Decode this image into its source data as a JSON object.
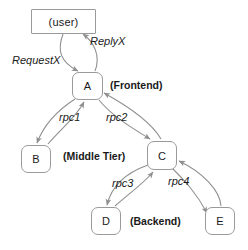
{
  "diagram": {
    "stroke_color": "#8f8f8f",
    "text_color": "#1a1a1a",
    "background": "#ffffff",
    "nodes": [
      {
        "id": "user",
        "label": "(user)",
        "shape": "square",
        "x": 31,
        "y": 9,
        "w": 65,
        "h": 25
      },
      {
        "id": "A",
        "label": "A",
        "shape": "rounded",
        "x": 72,
        "y": 72,
        "w": 31,
        "h": 28
      },
      {
        "id": "B",
        "label": "B",
        "shape": "rounded",
        "x": 21,
        "y": 145,
        "w": 30,
        "h": 28
      },
      {
        "id": "C",
        "label": "C",
        "shape": "rounded",
        "x": 147,
        "y": 141,
        "w": 30,
        "h": 29
      },
      {
        "id": "D",
        "label": "D",
        "shape": "rounded",
        "x": 91,
        "y": 207,
        "w": 30,
        "h": 28
      },
      {
        "id": "E",
        "label": "E",
        "shape": "rounded",
        "x": 205,
        "y": 207,
        "w": 30,
        "h": 28
      }
    ],
    "edge_labels": [
      {
        "id": "requestx",
        "text": "RequestX",
        "style": "italic",
        "x": 12,
        "y": 55
      },
      {
        "id": "replyx",
        "text": "ReplyX",
        "style": "italic",
        "x": 90,
        "y": 36
      },
      {
        "id": "rpc1",
        "text": "rpc1",
        "style": "italic",
        "x": 59,
        "y": 112
      },
      {
        "id": "rpc2",
        "text": "rpc2",
        "style": "italic",
        "x": 106,
        "y": 112
      },
      {
        "id": "rpc3",
        "text": "rpc3",
        "style": "italic",
        "x": 112,
        "y": 178
      },
      {
        "id": "rpc4",
        "text": "rpc4",
        "style": "italic",
        "x": 168,
        "y": 176
      }
    ],
    "tier_labels": [
      {
        "id": "frontend",
        "text": "(Frontend)",
        "style": "bold",
        "x": 110,
        "y": 80
      },
      {
        "id": "middle-tier",
        "text": "(Middle Tier)",
        "style": "bold",
        "x": 63,
        "y": 151
      },
      {
        "id": "backend",
        "text": "(Backend)",
        "style": "bold",
        "x": 130,
        "y": 216
      }
    ],
    "edges": [
      {
        "id": "user-to-a",
        "from": "user",
        "to": "A",
        "label": "RequestX"
      },
      {
        "id": "a-to-user",
        "from": "A",
        "to": "user",
        "label": "ReplyX"
      },
      {
        "id": "a-to-b",
        "from": "A",
        "to": "B",
        "label": "rpc1"
      },
      {
        "id": "b-to-a",
        "from": "B",
        "to": "A",
        "label": "rpc1"
      },
      {
        "id": "a-to-c",
        "from": "A",
        "to": "C",
        "label": "rpc2"
      },
      {
        "id": "c-to-a",
        "from": "C",
        "to": "A",
        "label": "rpc2"
      },
      {
        "id": "c-to-d",
        "from": "C",
        "to": "D",
        "label": "rpc3"
      },
      {
        "id": "d-to-c",
        "from": "D",
        "to": "C",
        "label": "rpc3"
      },
      {
        "id": "c-to-e",
        "from": "C",
        "to": "E",
        "label": "rpc4"
      },
      {
        "id": "e-to-c",
        "from": "E",
        "to": "C",
        "label": "rpc4"
      }
    ]
  }
}
